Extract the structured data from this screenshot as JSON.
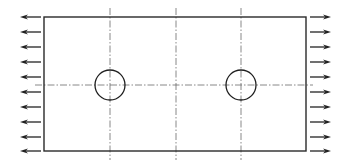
{
  "diagram": {
    "canvas": {
      "width": 347,
      "height": 165
    },
    "plate": {
      "x": 44,
      "y": 17,
      "width": 262,
      "height": 134,
      "stroke": "#2a2a2a"
    },
    "holes": [
      {
        "id": "hole-left",
        "cx": 110,
        "cy": 85,
        "r": 15
      },
      {
        "id": "hole-right",
        "cx": 241,
        "cy": 85,
        "r": 15
      }
    ],
    "centerlines": {
      "horizontal": {
        "y": 85,
        "x1": 35,
        "x2": 313
      },
      "vertical": [
        {
          "x": 110,
          "y1": 8,
          "y2": 160
        },
        {
          "x": 176,
          "y1": 8,
          "y2": 160
        },
        {
          "x": 241,
          "y1": 8,
          "y2": 160
        }
      ],
      "color": "#6a6a6a"
    },
    "loads": {
      "type": "uniform tensile traction",
      "left": {
        "direction": "left",
        "x_tip": 20,
        "x_tail": 41,
        "count": 10
      },
      "right": {
        "direction": "right",
        "x_tail": 310,
        "x_tip": 331,
        "count": 10
      },
      "y_positions": [
        17,
        32,
        47,
        62,
        77,
        92,
        107,
        122,
        137,
        151
      ],
      "color": "#222222"
    }
  }
}
